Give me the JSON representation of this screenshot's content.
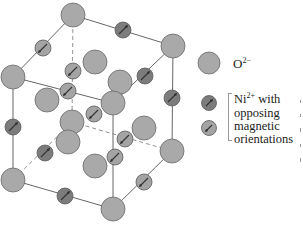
{
  "figure": {
    "colors": {
      "oxygen_fill": "#a9a9a9",
      "oxygen_stroke": "#6a6a6a",
      "ni_dark_fill": "#7c7c7c",
      "ni_light_fill": "#a4a4a4",
      "ni_stroke": "#5a5a5a",
      "bond": "#555555",
      "arrow": "#333333"
    }
  },
  "legend": {
    "oxygen": {
      "label": "O",
      "charge": "2−"
    },
    "nickel": {
      "label": "Ni",
      "charge": "2+",
      "line1_suffix": " with",
      "line2": "opposing",
      "line3": "magnetic",
      "line4": "orientations"
    }
  }
}
